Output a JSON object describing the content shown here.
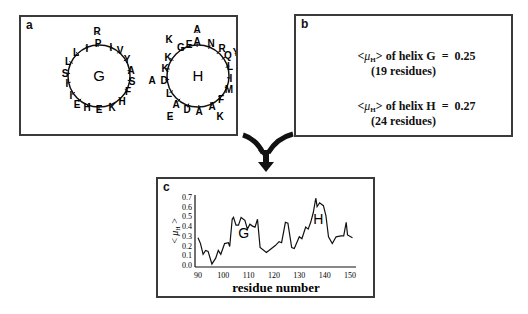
{
  "panel_a": {
    "letter": "a",
    "helix_g": {
      "label": "G",
      "residues": [
        {
          "aa": "R",
          "x": 76,
          "y": 14,
          "outer": true
        },
        {
          "aa": "P",
          "x": 77,
          "y": 26
        },
        {
          "aa": "I",
          "x": 90,
          "y": 30
        },
        {
          "aa": "V",
          "x": 99,
          "y": 33
        },
        {
          "aa": "Y",
          "x": 106,
          "y": 42
        },
        {
          "aa": "A",
          "x": 110,
          "y": 53
        },
        {
          "aa": "S",
          "x": 111,
          "y": 64
        },
        {
          "aa": "F",
          "x": 107,
          "y": 74
        },
        {
          "aa": "H",
          "x": 101,
          "y": 84
        },
        {
          "aa": "K",
          "x": 91,
          "y": 90
        },
        {
          "aa": "E",
          "x": 78,
          "y": 92
        },
        {
          "aa": "H",
          "x": 66,
          "y": 90
        },
        {
          "aa": "E",
          "x": 56,
          "y": 87
        },
        {
          "aa": "I",
          "x": 50,
          "y": 78
        },
        {
          "aa": "I",
          "x": 46,
          "y": 66
        },
        {
          "aa": "S",
          "x": 44,
          "y": 56
        },
        {
          "aa": "L",
          "x": 47,
          "y": 44
        },
        {
          "aa": "L",
          "x": 55,
          "y": 35
        },
        {
          "aa": "I",
          "x": 66,
          "y": 31
        }
      ]
    },
    "helix_h": {
      "label": "H",
      "residues": [
        {
          "aa": "A",
          "x": 176,
          "y": 12,
          "outer": true
        },
        {
          "aa": "A",
          "x": 176,
          "y": 24
        },
        {
          "aa": "N",
          "x": 190,
          "y": 26
        },
        {
          "aa": "R",
          "x": 201,
          "y": 31
        },
        {
          "aa": "Q",
          "x": 207,
          "y": 38
        },
        {
          "aa": "Y",
          "x": 215,
          "y": 35,
          "outer": true
        },
        {
          "aa": "L",
          "x": 209,
          "y": 49
        },
        {
          "aa": "I",
          "x": 210,
          "y": 61
        },
        {
          "aa": "M",
          "x": 208,
          "y": 72
        },
        {
          "aa": "F",
          "x": 200,
          "y": 82
        },
        {
          "aa": "K",
          "x": 199,
          "y": 99,
          "outer": true
        },
        {
          "aa": "A",
          "x": 191,
          "y": 89
        },
        {
          "aa": "A",
          "x": 178,
          "y": 94
        },
        {
          "aa": "D",
          "x": 166,
          "y": 92
        },
        {
          "aa": "A",
          "x": 155,
          "y": 87
        },
        {
          "aa": "E",
          "x": 149,
          "y": 99,
          "outer": true
        },
        {
          "aa": "L",
          "x": 148,
          "y": 76
        },
        {
          "aa": "D",
          "x": 143,
          "y": 63
        },
        {
          "aa": "A",
          "x": 131,
          "y": 63,
          "outer": true
        },
        {
          "aa": "K",
          "x": 144,
          "y": 51
        },
        {
          "aa": "K",
          "x": 147,
          "y": 40
        },
        {
          "aa": "G",
          "x": 160,
          "y": 30
        },
        {
          "aa": "K",
          "x": 148,
          "y": 22,
          "outer": true
        },
        {
          "aa": "E",
          "x": 168,
          "y": 27
        }
      ]
    }
  },
  "panel_b": {
    "letter": "b",
    "lines": [
      {
        "prefix": "<",
        "mu": "μ",
        "sub": "H",
        "suffix": "> of helix G  =  0.25"
      },
      {
        "text": "(19 residues)"
      },
      {
        "prefix": "<",
        "mu": "μ",
        "sub": "H",
        "suffix": "> of helix H  =  0.27"
      },
      {
        "text": "(24 residues)"
      }
    ],
    "values": {
      "helix_g": {
        "mean_mu_h": 0.25,
        "residues": 19
      },
      "helix_h": {
        "mean_mu_h": 0.27,
        "residues": 24
      }
    }
  },
  "panel_c": {
    "letter": "c",
    "annotation_g": "G",
    "annotation_h": "H"
  },
  "chart_data": {
    "type": "line",
    "title": "",
    "xlabel": "residue number",
    "ylabel": "<μH>",
    "xlim": [
      90,
      151
    ],
    "ylim": [
      0.0,
      0.7
    ],
    "xticks": [
      90,
      100,
      110,
      120,
      130,
      140,
      150
    ],
    "yticks": [
      0.0,
      0.1,
      0.2,
      0.3,
      0.4,
      0.5,
      0.6,
      0.7
    ],
    "grid": false,
    "annotations": [
      {
        "text": "G",
        "x": 108,
        "y": 0.28
      },
      {
        "text": "H",
        "x": 137.5,
        "y": 0.42
      }
    ],
    "series": [
      {
        "name": "<μH>",
        "x": [
          90,
          91,
          92,
          93,
          94,
          95.5,
          97,
          98,
          99,
          100.5,
          102,
          102.5,
          103.5,
          104,
          105,
          106,
          107,
          108.5,
          109.5,
          110.5,
          111.5,
          112.5,
          113.5,
          114.5,
          117,
          119,
          120.5,
          122,
          123,
          124.5,
          125.5,
          127,
          128,
          130,
          131,
          132.5,
          133.5,
          134.5,
          135.5,
          136.5,
          137,
          138,
          139.5,
          140.5,
          141.5,
          143,
          144.5,
          146.5,
          147.5,
          148.5,
          149,
          151
        ],
        "values": [
          0.28,
          0.22,
          0.11,
          0.15,
          0.14,
          0.01,
          0.07,
          0.15,
          0.11,
          0.22,
          0.23,
          0.19,
          0.47,
          0.49,
          0.41,
          0.41,
          0.49,
          0.46,
          0.37,
          0.42,
          0.4,
          0.39,
          0.47,
          0.18,
          0.13,
          0.17,
          0.2,
          0.24,
          0.23,
          0.44,
          0.43,
          0.18,
          0.17,
          0.29,
          0.27,
          0.39,
          0.37,
          0.44,
          0.54,
          0.69,
          0.6,
          0.64,
          0.61,
          0.51,
          0.29,
          0.22,
          0.29,
          0.3,
          0.3,
          0.44,
          0.31,
          0.28
        ]
      }
    ]
  },
  "arrows": {
    "color": "#111111"
  }
}
